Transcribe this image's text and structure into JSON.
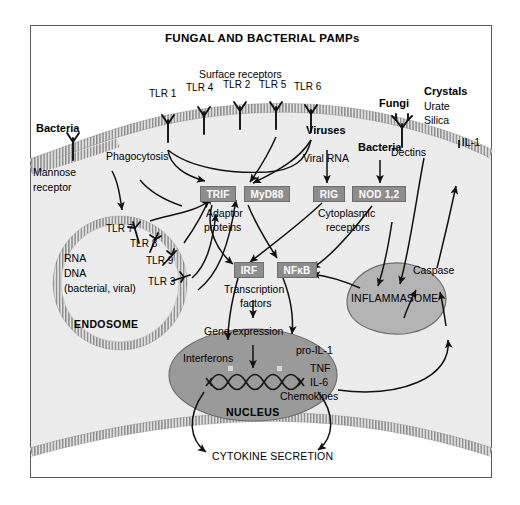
{
  "figure": {
    "title": "FUNGAL AND BACTERIAL PAMPs",
    "type": "biological-signaling-diagram",
    "frame_color": "#5a5a5a",
    "cytoplasm_color": "#ececec",
    "nucleus_color": "#9a9a9a",
    "inflammasome_color": "#b4b4b4",
    "protein_box_color": "#8d8d8d",
    "membrane_color": "#9d9d9d"
  },
  "surface": {
    "group_label": "Surface receptors",
    "receptors": [
      {
        "label": "TLR 1"
      },
      {
        "label": "TLR 4"
      },
      {
        "label": "TLR 2"
      },
      {
        "label": "TLR 5"
      },
      {
        "label": "TLR 6"
      }
    ]
  },
  "left": {
    "bacteria": "Bacteria",
    "mannose_receptor": "Mannose\nreceptor",
    "mannose_line1": "Mannose",
    "mannose_line2": "receptor",
    "phagocytosis": "Phagocytosis"
  },
  "endosome": {
    "name": "ENDOSOME",
    "receptors": [
      {
        "label": "TLR 7"
      },
      {
        "label": "TLR 8"
      },
      {
        "label": "TLR 9"
      },
      {
        "label": "TLR 3"
      }
    ],
    "contents": [
      "RNA",
      "DNA",
      "(bacterial, viral)"
    ]
  },
  "viruses": {
    "label": "Viruses",
    "ligand": "Viral RNA"
  },
  "cytoplasm_bacteria": {
    "label": "Bacteria"
  },
  "fungi": {
    "label": "Fungi",
    "receptor": "Dectins"
  },
  "crystals": {
    "label": "Crystals",
    "items": [
      "Urate",
      "Silica"
    ]
  },
  "caspase": {
    "label": "Caspase",
    "product": "IL-1"
  },
  "adaptors": {
    "boxes": [
      {
        "label": "TRIF"
      },
      {
        "label": "MyD88"
      }
    ],
    "caption_line1": "Adaptor",
    "caption_line2": "proteins"
  },
  "cytoplasmic_receptors": {
    "boxes": [
      {
        "label": "RIG"
      },
      {
        "label": "NOD 1,2"
      }
    ],
    "caption_line1": "Cytoplasmic",
    "caption_line2": "receptors"
  },
  "transcription_factors": {
    "boxes": [
      {
        "label": "IRF"
      },
      {
        "label": "NFκB"
      }
    ],
    "caption_line1": "Transcription",
    "caption_line2": "factors"
  },
  "inflammasome": {
    "label": "INFLAMMASOME"
  },
  "nucleus": {
    "name": "NUCLEUS",
    "gene_expression": "Gene expression",
    "outputs_left": [
      "Interferons"
    ],
    "outputs_right": [
      "pro-IL-1",
      "TNF",
      "IL-6",
      "Chemokines"
    ]
  },
  "secretion": {
    "label": "CYTOKINE SECRETION"
  }
}
